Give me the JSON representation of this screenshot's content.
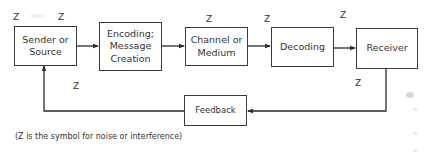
{
  "diagram": {
    "boxes": [
      {
        "id": "sender",
        "label": "Sender or\nSource"
      },
      {
        "id": "encoding",
        "label": "Encoding;\nMessage\nCreation"
      },
      {
        "id": "channel",
        "label": "Channel or\nMedium"
      },
      {
        "id": "decoding",
        "label": "Decoding"
      },
      {
        "id": "receiver",
        "label": "Receiver"
      },
      {
        "id": "feedback",
        "label": "Feedback"
      }
    ],
    "edges": [
      {
        "from": "sender",
        "to": "encoding"
      },
      {
        "from": "encoding",
        "to": "channel"
      },
      {
        "from": "channel",
        "to": "decoding"
      },
      {
        "from": "decoding",
        "to": "receiver"
      },
      {
        "from": "receiver",
        "to": "feedback"
      },
      {
        "from": "feedback",
        "to": "sender"
      }
    ],
    "noise_symbol": "Z",
    "noise_markers": [
      {
        "near": "sender-top-left",
        "label": "Z"
      },
      {
        "near": "sender-top-right",
        "label": "Z"
      },
      {
        "near": "channel-top",
        "label": "Z"
      },
      {
        "near": "decoding-top-left",
        "label": "Z"
      },
      {
        "near": "receiver-top",
        "label": "Z"
      },
      {
        "near": "feedback-loop-left",
        "label": "Z"
      },
      {
        "near": "feedback-loop-right",
        "label": "Z"
      }
    ],
    "caption": "(Z is the symbol for noise or interference)",
    "colors": {
      "line": "#2a2a2a",
      "text": "#333333",
      "background": "#ffffff"
    }
  }
}
